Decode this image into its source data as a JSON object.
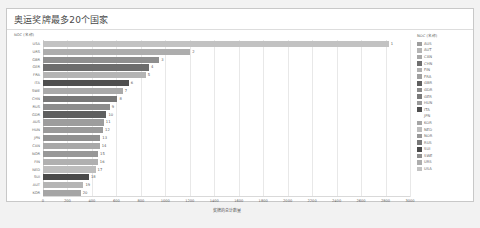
{
  "card": {
    "title": "奥运奖牌最多20个国家",
    "y_axis_title": "NOC (名称)"
  },
  "legend": {
    "title": "NOC (名称)",
    "items": [
      {
        "label": "AUS",
        "color": "#9d9d9d"
      },
      {
        "label": "AUT",
        "color": "#b5b5b5"
      },
      {
        "label": "CAN",
        "color": "#a8a8a8"
      },
      {
        "label": "CHN",
        "color": "#6f6f6f"
      },
      {
        "label": "FIN",
        "color": "#b0b0b0"
      },
      {
        "label": "FRA",
        "color": "#a0a0a0"
      },
      {
        "label": "GBR",
        "color": "#5f5f5f"
      },
      {
        "label": "GDR",
        "color": "#8a8a8a"
      },
      {
        "label": "GER",
        "color": "#7a7a7a"
      },
      {
        "label": "HUN",
        "color": "#9a9a9a"
      },
      {
        "label": "ITA",
        "color": "#4f4f4f"
      },
      {
        "label": "JPN",
        "color": "#9090 90"
      },
      {
        "label": "KOR",
        "color": "#a5a5a5"
      },
      {
        "label": "NED",
        "color": "#bdbdbd"
      },
      {
        "label": "NOR",
        "color": "#989898"
      },
      {
        "label": "RUS",
        "color": "#787878"
      },
      {
        "label": "SUI",
        "color": "#4a4a4a"
      },
      {
        "label": "SWE",
        "color": "#8e8e8e"
      },
      {
        "label": "URS",
        "color": "#adadad"
      },
      {
        "label": "USA",
        "color": "#c2c2c2"
      }
    ]
  },
  "caption": "",
  "chart_data": {
    "type": "bar",
    "orientation": "horizontal",
    "title": "奥运奖牌最多20个国家",
    "xlabel": "奖牌的总计数量",
    "ylabel": "NOC (名称)",
    "xlim": [
      0,
      3000
    ],
    "grid": true,
    "legend_position": "right",
    "xticks": [
      0,
      200,
      400,
      600,
      800,
      1000,
      1200,
      1400,
      1600,
      1800,
      2000,
      2200,
      2400,
      2600,
      2800,
      3000
    ],
    "categories": [
      "USA",
      "URS",
      "GBR",
      "GER",
      "FRA",
      "ITA",
      "SWE",
      "CHN",
      "RUS",
      "GDR",
      "AUS",
      "HUN",
      "JPN",
      "CAN",
      "NOR",
      "FIN",
      "NED",
      "SUI",
      "AUT",
      "KOR"
    ],
    "values": [
      2826,
      1204,
      951,
      867,
      840,
      701,
      652,
      608,
      546,
      519,
      497,
      491,
      469,
      463,
      450,
      448,
      430,
      376,
      331,
      308
    ],
    "rank_labels": [
      "1",
      "2",
      "3",
      "4",
      "5",
      "6",
      "7",
      "8",
      "9",
      "10",
      "11",
      "12",
      "13",
      "14",
      "15",
      "16",
      "17",
      "18",
      "19",
      "20"
    ],
    "bar_colors": [
      "#c2c2c2",
      "#adadad",
      "#8f8f8f",
      "#6d6d6d",
      "#b4b4b4",
      "#4f4f4f",
      "#a9a9a9",
      "#777777",
      "#8c8c8c",
      "#5f5f5f",
      "#9d9d9d",
      "#9a9a9a",
      "#909090",
      "#a8a8a8",
      "#989898",
      "#b0b0b0",
      "#bdbdbd",
      "#4a4a4a",
      "#b5b5b5",
      "#a5a5a5"
    ]
  }
}
